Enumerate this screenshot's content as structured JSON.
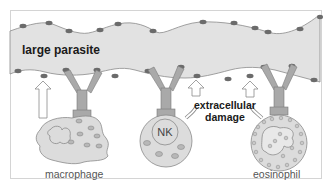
{
  "diagram": {
    "parasite": {
      "label": "large parasite"
    },
    "annotation": {
      "line1": "extracellular",
      "line2": "damage"
    },
    "cells": [
      {
        "name": "macrophage",
        "label": "macrophage",
        "inner_label": ""
      },
      {
        "name": "nk-cell",
        "label": "",
        "inner_label": "NK"
      },
      {
        "name": "eosinophil",
        "label": "eosinophil",
        "inner_label": ""
      }
    ],
    "colors": {
      "frame": "#d0d0d0",
      "parasite_fill": "#e2e2e2",
      "parasite_stroke": "#8a8a8a",
      "antigen": "#6b6b6b",
      "antibody": "#a9a9a9",
      "cell_fill": "#dcdcdc",
      "granule": "#b8b8b8",
      "arrow_fill": "#ffffff",
      "arrow_stroke": "#8a8a8a"
    }
  }
}
